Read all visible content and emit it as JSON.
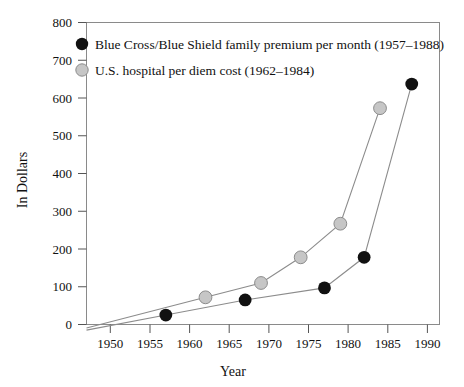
{
  "chart_data": {
    "type": "line",
    "title": "",
    "xlabel": "Year",
    "ylabel": "In Dollars",
    "xlim": [
      1947,
      1991.5
    ],
    "ylim": [
      0,
      800
    ],
    "grid": false,
    "legend_position": "top-left-inside",
    "xticks": [
      1950,
      1955,
      1960,
      1965,
      1970,
      1975,
      1980,
      1985,
      1990
    ],
    "xtick_labels": [
      "1950",
      "1955",
      "1960",
      "1965",
      "1970",
      "1975",
      "1980",
      "1985",
      "1990"
    ],
    "yticks": [
      0,
      100,
      200,
      300,
      400,
      500,
      600,
      700,
      800
    ],
    "ytick_labels": [
      "0",
      "100",
      "200",
      "300",
      "400",
      "500",
      "600",
      "700",
      "800"
    ],
    "series": [
      {
        "name": "Blue Cross/Blue Shield family premium per month (1957–1988)",
        "marker": "filled-black-circle",
        "color": "#111111",
        "line_color": "#8c8c8c",
        "x": [
          1957,
          1967,
          1977,
          1982,
          1988
        ],
        "values": [
          25,
          65,
          97,
          178,
          637
        ]
      },
      {
        "name": "U.S. hospital per diem cost (1962–1984)",
        "marker": "filled-gray-circle",
        "color": "#c6c6c6",
        "line_color": "#8c8c8c",
        "x": [
          1962,
          1969,
          1974,
          1979,
          1984
        ],
        "values": [
          72,
          110,
          178,
          267,
          573
        ]
      }
    ]
  },
  "legend": {
    "items": [
      {
        "label": "Blue Cross/Blue Shield family premium per month (1957–1988)",
        "marker_color": "#111111"
      },
      {
        "label": "U.S. hospital per diem cost (1962–1984)",
        "marker_color": "#c6c6c6"
      }
    ]
  },
  "axes": {
    "x_title": "Year",
    "y_title": "In Dollars"
  }
}
